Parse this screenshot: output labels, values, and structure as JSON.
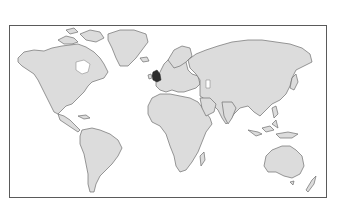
{
  "map": {
    "type": "world-outline",
    "projection": "equirectangular",
    "land_color": "#dcdcdc",
    "outline_color": "#6e6e6e",
    "water_color": "#ffffff",
    "frame_color": "#5a5a5a",
    "highlight": {
      "region": "United Kingdom / Low Countries",
      "color": "#2e2e2e"
    },
    "continents": [
      "North America",
      "Greenland",
      "South America",
      "Europe",
      "Africa",
      "Asia",
      "Australia",
      "New Zealand"
    ]
  }
}
